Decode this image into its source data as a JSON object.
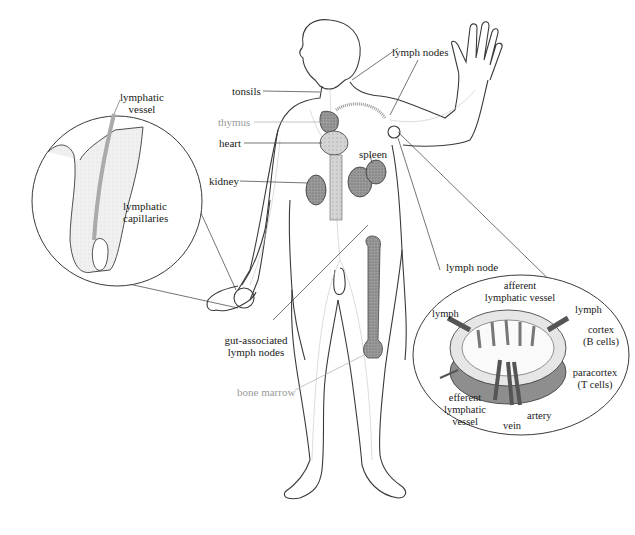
{
  "diagram": {
    "colors": {
      "outline": "#3a3a3a",
      "vessels": "#b8b8b8",
      "organ_fill": "#8c8c8c",
      "organ_dark": "#555555",
      "node_fill": "#a8a8a8",
      "gray_label": "#9a9a9a",
      "ink": "#1a1a1a"
    },
    "body_labels": {
      "tonsils": "tonsils",
      "thymus": "thymus",
      "heart": "heart",
      "kidney": "kidney",
      "lymph_nodes": "lymph nodes",
      "spleen": "spleen",
      "gut_associated_line1": "gut-associated",
      "gut_associated_line2": "lymph nodes",
      "bone_marrow": "bone marrow"
    },
    "finger_inset": {
      "lymphatic_vessel_line1": "lymphatic",
      "lymphatic_vessel_line2": "vessel",
      "capillaries_line1": "lymphatic",
      "capillaries_line2": "capillaries"
    },
    "node_inset": {
      "title": "lymph node",
      "afferent_line1": "afferent",
      "afferent_line2": "lymphatic vessel",
      "lymph_left": "lymph",
      "lymph_right": "lymph",
      "cortex_line1": "cortex",
      "cortex_line2": "(B cells)",
      "paracortex_line1": "paracortex",
      "paracortex_line2": "(T cells)",
      "efferent_line1": "efferent",
      "efferent_line2": "lymphatic",
      "efferent_line3": "vessel",
      "artery": "artery",
      "vein": "vein"
    }
  }
}
